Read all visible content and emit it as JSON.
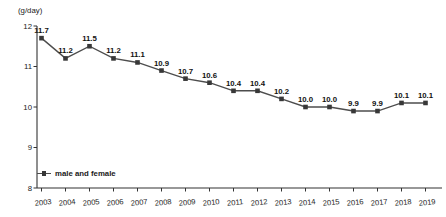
{
  "chart_data": {
    "type": "line",
    "title": "",
    "unit_label": "(g/day)",
    "xlabel": "",
    "ylabel": "g/day",
    "categories": [
      "2003",
      "2004",
      "2005",
      "2006",
      "2007",
      "2008",
      "2009",
      "2010",
      "2011",
      "2012",
      "2013",
      "2014",
      "2015",
      "2016",
      "2017",
      "2018",
      "2019"
    ],
    "series": [
      {
        "name": "male and female",
        "values": [
          11.7,
          11.2,
          11.5,
          11.2,
          11.1,
          10.9,
          10.7,
          10.6,
          10.4,
          10.4,
          10.2,
          10.0,
          10.0,
          9.9,
          9.9,
          10.1,
          10.1
        ]
      }
    ],
    "ylim": [
      8,
      12
    ],
    "yticks": [
      8,
      9,
      10,
      11,
      12
    ],
    "grid": false,
    "legend_position": "inside-bottom-left",
    "show_point_labels": true,
    "colors": {
      "line": "#4d4d4d",
      "marker": "#383838",
      "point_label": "#111111",
      "axis": "#333333",
      "tick_label": "#222222"
    }
  }
}
